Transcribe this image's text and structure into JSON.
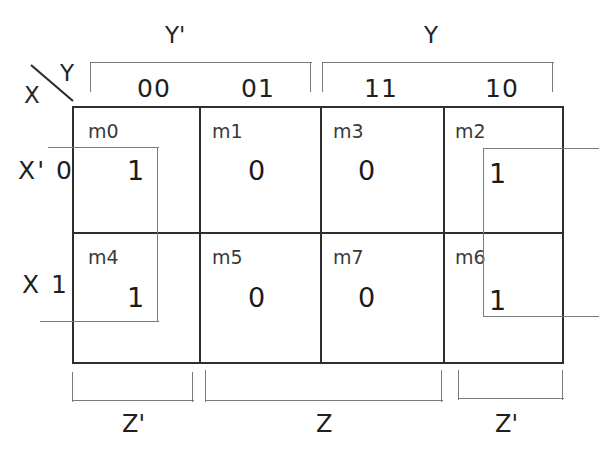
{
  "diagram": {
    "type": "karnaugh-map",
    "row_variable": "X",
    "col_variables": "YZ",
    "corner": {
      "col_label": "Y",
      "row_label": "X"
    },
    "top_groups": [
      {
        "label": "Y'",
        "covers": [
          "00",
          "01"
        ]
      },
      {
        "label": "Y",
        "covers": [
          "11",
          "10"
        ]
      }
    ],
    "bottom_groups": [
      {
        "label": "Z'",
        "covers": [
          "00"
        ]
      },
      {
        "label": "Z",
        "covers": [
          "01",
          "11"
        ]
      },
      {
        "label": "Z'",
        "covers": [
          "10"
        ]
      }
    ],
    "columns": [
      {
        "code": "00"
      },
      {
        "code": "01"
      },
      {
        "code": "11"
      },
      {
        "code": "10"
      }
    ],
    "rows": [
      {
        "var_label": "X'",
        "code": "0"
      },
      {
        "var_label": "X",
        "code": "1"
      }
    ],
    "cells": [
      {
        "minterm": "m0",
        "value": "1",
        "row": 0,
        "col": 0,
        "grouped": true
      },
      {
        "minterm": "m1",
        "value": "0",
        "row": 0,
        "col": 1,
        "grouped": false
      },
      {
        "minterm": "m3",
        "value": "0",
        "row": 0,
        "col": 2,
        "grouped": false
      },
      {
        "minterm": "m2",
        "value": "1",
        "row": 0,
        "col": 3,
        "grouped": true
      },
      {
        "minterm": "m4",
        "value": "1",
        "row": 1,
        "col": 0,
        "grouped": true
      },
      {
        "minterm": "m5",
        "value": "0",
        "row": 1,
        "col": 1,
        "grouped": false
      },
      {
        "minterm": "m7",
        "value": "0",
        "row": 1,
        "col": 2,
        "grouped": false
      },
      {
        "minterm": "m6",
        "value": "1",
        "row": 1,
        "col": 3,
        "grouped": true
      }
    ],
    "groupings": [
      {
        "name": "left-wrap-group",
        "cells": [
          "m0",
          "m4"
        ],
        "wraps": "left-edge"
      },
      {
        "name": "right-wrap-group",
        "cells": [
          "m2",
          "m6"
        ],
        "wraps": "right-edge"
      }
    ],
    "colors": {
      "grid": "#2e2e2e",
      "group": "#7a7a7a",
      "text": "#1a1a1a",
      "background": "#ffffff"
    }
  }
}
